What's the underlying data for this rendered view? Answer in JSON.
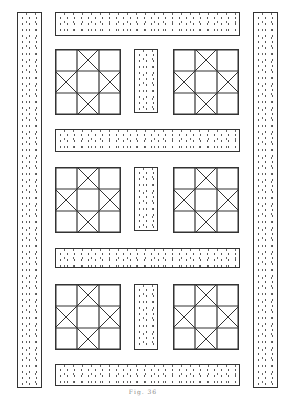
{
  "figure": {
    "type": "quilt-layout-diagram",
    "caption": "Fig. 36",
    "colors": {
      "line": "#333333",
      "background": "#ffffff",
      "dots": "#555555"
    },
    "rows": 3,
    "blocks_per_row": 2,
    "block_pattern": "star-with-x-cells"
  }
}
